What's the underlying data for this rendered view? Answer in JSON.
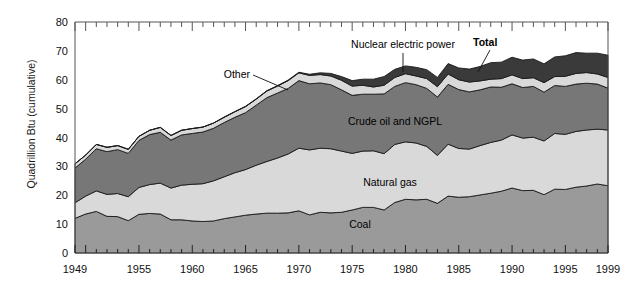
{
  "chart_data": {
    "type": "area",
    "title": "",
    "xlabel": "",
    "ylabel": "Quadrillion Btu (cumulative)",
    "xlim": [
      1949,
      1999
    ],
    "ylim": [
      0,
      80
    ],
    "ytick_labels": [
      "0",
      "10",
      "20",
      "30",
      "40",
      "50",
      "60",
      "70",
      "80"
    ],
    "ytick_values": [
      0,
      10,
      20,
      30,
      40,
      50,
      60,
      70,
      80
    ],
    "xtick_labels": [
      "1949",
      "1955",
      "1960",
      "1965",
      "1970",
      "1975",
      "1980",
      "1985",
      "1990",
      "1995",
      "1999"
    ],
    "xtick_values": [
      1949,
      1955,
      1960,
      1965,
      1970,
      1975,
      1980,
      1985,
      1990,
      1995,
      1999
    ],
    "grid": false,
    "legend": "inline-band-labels",
    "stacked": true,
    "x": [
      1949,
      1950,
      1951,
      1952,
      1953,
      1954,
      1955,
      1956,
      1957,
      1958,
      1959,
      1960,
      1961,
      1962,
      1963,
      1964,
      1965,
      1966,
      1967,
      1968,
      1969,
      1970,
      1971,
      1972,
      1973,
      1974,
      1975,
      1976,
      1977,
      1978,
      1979,
      1980,
      1981,
      1982,
      1983,
      1984,
      1985,
      1986,
      1987,
      1988,
      1989,
      1990,
      1991,
      1992,
      1993,
      1994,
      1995,
      1996,
      1997,
      1998,
      1999
    ],
    "series": [
      {
        "name": "Coal",
        "color": "#9a9a9a",
        "label": "Coal",
        "values": [
          12.0,
          13.5,
          14.4,
          12.7,
          12.6,
          11.2,
          13.4,
          13.7,
          13.5,
          11.5,
          11.5,
          11.1,
          10.9,
          11.1,
          11.9,
          12.5,
          13.1,
          13.5,
          13.8,
          13.8,
          13.9,
          14.6,
          13.2,
          14.1,
          13.9,
          14.1,
          14.9,
          15.8,
          15.8,
          14.9,
          17.5,
          18.6,
          18.4,
          18.6,
          17.2,
          19.7,
          19.3,
          19.5,
          20.1,
          20.7,
          21.4,
          22.5,
          21.6,
          21.7,
          20.2,
          22.1,
          22.0,
          22.8,
          23.2,
          23.9,
          23.3
        ]
      },
      {
        "name": "Natural gas",
        "color": "#d9d9d9",
        "label": "Natural gas",
        "values": [
          5.4,
          6.2,
          7.1,
          7.6,
          8.0,
          8.3,
          9.3,
          10.0,
          10.7,
          11.0,
          12.0,
          12.7,
          13.1,
          13.9,
          14.5,
          15.3,
          15.8,
          16.9,
          17.9,
          19.1,
          20.4,
          21.7,
          22.5,
          22.2,
          22.2,
          21.2,
          19.6,
          19.5,
          19.6,
          19.5,
          20.1,
          19.9,
          19.7,
          18.3,
          16.6,
          18.0,
          16.9,
          16.5,
          17.1,
          17.6,
          17.7,
          18.4,
          18.2,
          18.4,
          18.6,
          19.3,
          19.1,
          19.3,
          19.4,
          19.0,
          19.3
        ]
      },
      {
        "name": "Crude oil and NGPL",
        "color": "#777777",
        "label": "Crude oil and NGPL",
        "values": [
          12.0,
          12.8,
          14.6,
          14.8,
          15.2,
          15.0,
          16.3,
          17.3,
          17.6,
          16.6,
          17.4,
          17.6,
          17.9,
          18.2,
          18.8,
          19.2,
          19.7,
          20.8,
          22.1,
          22.5,
          22.7,
          23.4,
          22.9,
          22.6,
          22.2,
          21.2,
          20.1,
          19.7,
          19.6,
          20.7,
          20.1,
          20.5,
          20.2,
          20.1,
          20.2,
          20.7,
          20.4,
          19.8,
          19.3,
          19.2,
          18.3,
          17.7,
          17.5,
          17.6,
          16.9,
          16.6,
          16.6,
          16.4,
          16.2,
          15.6,
          14.5
        ]
      },
      {
        "name": "Other",
        "color": "#d9d9d9",
        "label": "Other",
        "values": [
          1.5,
          1.4,
          1.5,
          1.5,
          1.4,
          1.4,
          1.4,
          1.5,
          1.7,
          1.6,
          1.6,
          1.7,
          1.7,
          1.8,
          1.8,
          1.9,
          2.1,
          2.1,
          2.3,
          2.4,
          2.7,
          2.7,
          2.9,
          2.9,
          3.0,
          3.3,
          3.2,
          3.1,
          2.5,
          3.0,
          3.1,
          3.1,
          3.0,
          3.4,
          3.6,
          3.6,
          3.4,
          3.4,
          3.1,
          2.7,
          3.0,
          3.1,
          3.1,
          3.0,
          3.3,
          3.1,
          3.5,
          3.7,
          3.7,
          3.5,
          3.7
        ]
      },
      {
        "name": "Nuclear electric power",
        "color": "#3a3a3a",
        "label": "Nuclear electric power",
        "values": [
          0.0,
          0.0,
          0.0,
          0.0,
          0.0,
          0.0,
          0.0,
          0.0,
          0.0,
          0.0,
          0.0,
          0.0,
          0.0,
          0.0,
          0.1,
          0.1,
          0.1,
          0.1,
          0.1,
          0.2,
          0.2,
          0.2,
          0.4,
          0.6,
          0.9,
          1.3,
          1.9,
          2.1,
          2.7,
          3.0,
          2.8,
          2.7,
          3.0,
          3.1,
          3.2,
          3.6,
          4.1,
          4.5,
          5.0,
          5.7,
          5.7,
          6.1,
          6.4,
          6.5,
          6.5,
          6.8,
          7.1,
          7.2,
          6.7,
          7.2,
          7.7
        ]
      }
    ],
    "total_label": "Total",
    "annotations": [
      {
        "text": "Other",
        "type": "leader-label"
      },
      {
        "text": "Nuclear electric power",
        "type": "leader-label"
      },
      {
        "text": "Total",
        "type": "leader-label",
        "bold": true
      },
      {
        "text": "Crude oil and NGPL",
        "type": "band-label"
      },
      {
        "text": "Natural gas",
        "type": "band-label"
      },
      {
        "text": "Coal",
        "type": "band-label"
      }
    ]
  }
}
